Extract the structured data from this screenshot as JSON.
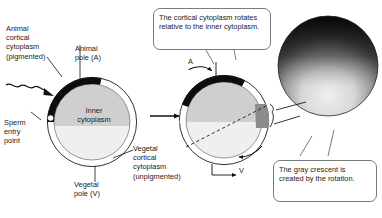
{
  "figure": {
    "type": "diagram"
  },
  "labels": {
    "animal_cortical": "Animal\ncortical\ncytoplasm\n(pigmented)",
    "animal_pole": "Animal\npole (A)",
    "inner_cytoplasm": "Inner\ncytoplasm",
    "sperm_entry": "Sperm\nentry\npoint",
    "vegetal_pole": "Vegetal\npole (V)",
    "vegetal_cortical": "Vegetal\ncortical\ncytoplasm\n(unpigmented)",
    "pole_a_short": "A",
    "pole_v_short": "V"
  },
  "callouts": {
    "rotation": "The cortical cytoplasm rotates relative to the inner cytoplasm.",
    "crescent": "The gray crescent is created by the rotation."
  },
  "colors": {
    "pigmented_cortex": "#111111",
    "inner_cytoplasm": "#d0d0d0",
    "inner_cytoplasm_light": "#e8e8e8",
    "gray_crescent": "#8f8f8f",
    "outline": "#1a1a1a",
    "callout_border": "#7a7a7a",
    "background": "#ffffff"
  },
  "icons": {
    "process_arrow": "arrow-right-icon",
    "rotation_arrow": "curved-rotation-arrow-icon",
    "sperm": "sperm-icon",
    "magnified_egg": "magnified-egg-photo-icon"
  }
}
